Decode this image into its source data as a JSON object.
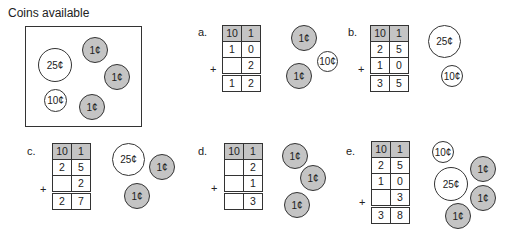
{
  "title": "Coins available",
  "available": {
    "coins": [
      {
        "label": "25¢",
        "type": "quarter"
      },
      {
        "label": "1¢",
        "type": "penny"
      },
      {
        "label": "1¢",
        "type": "penny"
      },
      {
        "label": "10¢",
        "type": "dime"
      },
      {
        "label": "1¢",
        "type": "penny"
      }
    ]
  },
  "header": {
    "tens": "10",
    "ones": "1"
  },
  "plus": "+",
  "problems": [
    {
      "label": "a.",
      "rows": [
        [
          "1",
          "0"
        ],
        [
          "",
          "2"
        ]
      ],
      "sum": [
        "1",
        "2"
      ],
      "coins": [
        "1¢",
        "10¢",
        "1¢"
      ]
    },
    {
      "label": "b.",
      "rows": [
        [
          "2",
          "5"
        ],
        [
          "1",
          "0"
        ]
      ],
      "sum": [
        "3",
        "5"
      ],
      "coins": [
        "25¢",
        "10¢"
      ]
    },
    {
      "label": "c.",
      "rows": [
        [
          "2",
          "5"
        ],
        [
          "",
          "2"
        ]
      ],
      "sum": [
        "2",
        "7"
      ],
      "coins": [
        "25¢",
        "1¢",
        "1¢"
      ]
    },
    {
      "label": "d.",
      "rows": [
        [
          "",
          "2"
        ],
        [
          "",
          "1"
        ]
      ],
      "sum": [
        "",
        "3"
      ],
      "coins": [
        "1¢",
        "1¢",
        "1¢"
      ]
    },
    {
      "label": "e.",
      "rows": [
        [
          "2",
          "5"
        ],
        [
          "1",
          "0"
        ],
        [
          "",
          "3"
        ]
      ],
      "sum": [
        "3",
        "8"
      ],
      "coins": [
        "10¢",
        "1¢",
        "25¢",
        "1¢",
        "1¢"
      ]
    }
  ]
}
